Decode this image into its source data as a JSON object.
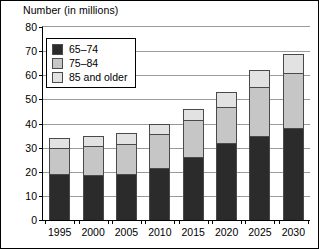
{
  "chart_data": {
    "type": "bar",
    "stacked": true,
    "title": "",
    "ylabel": "Number (in millions)",
    "xlabel": "",
    "ylim": [
      0,
      80
    ],
    "yticks": [
      0,
      10,
      20,
      30,
      40,
      50,
      60,
      70,
      80
    ],
    "grid": true,
    "legend_position": "upper-left-inside",
    "categories": [
      "1995",
      "2000",
      "2005",
      "2010",
      "2015",
      "2020",
      "2025",
      "2030"
    ],
    "series": [
      {
        "name": "65–74",
        "color": "#2b2b2b",
        "values": [
          19,
          18.5,
          19,
          21.5,
          26,
          32,
          35,
          38
        ]
      },
      {
        "name": "75–84",
        "color": "#c6c6c6",
        "values": [
          11,
          12,
          12.5,
          14,
          15.5,
          15,
          20,
          23
        ]
      },
      {
        "name": "85 and older",
        "color": "#e2e2e2",
        "values": [
          4,
          4.5,
          4.5,
          4.5,
          4.5,
          6,
          7,
          8
        ]
      }
    ],
    "totals": [
      34,
      35,
      36,
      40,
      46,
      53,
      62,
      69
    ]
  }
}
